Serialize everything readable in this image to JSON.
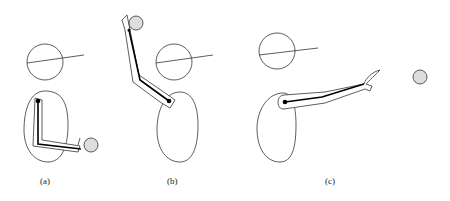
{
  "panels": [
    {
      "id": "a",
      "label": "(a)",
      "description": "arm bent, holding ball at waist"
    },
    {
      "id": "b",
      "label": "(b)",
      "description": "arm raised overhead holding ball"
    },
    {
      "id": "c",
      "label": "(c)",
      "description": "arm extended forward, ball released"
    }
  ],
  "colors": {
    "stroke": "#333333",
    "ball": "#dddddd",
    "joint": "#000000"
  }
}
